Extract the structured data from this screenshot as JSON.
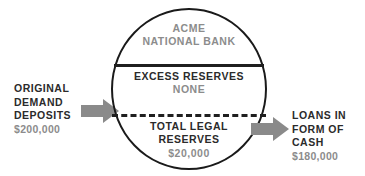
{
  "diagram": {
    "colors": {
      "stroke": "#1a1a1a",
      "text_dark": "#2b2b2b",
      "text_gray": "#8c8c8c",
      "arrow_fill": "#8a8a8a",
      "background": "#ffffff"
    },
    "bank": {
      "header": {
        "line1": "ACME",
        "line2": "NATIONAL BANK"
      },
      "sections": [
        {
          "id": "excess-reserves",
          "label": "EXCESS RESERVES",
          "value": "NONE"
        },
        {
          "id": "total-legal-reserves",
          "label_line1": "TOTAL LEGAL",
          "label_line2": "RESERVES",
          "value": "$20,000"
        }
      ]
    },
    "inflow": {
      "line1": "ORIGINAL",
      "line2": "DEMAND",
      "line3": "DEPOSITS",
      "amount": "$200,000",
      "arrow_icon": "arrow-right-icon"
    },
    "outflow": {
      "line1": "LOANS IN",
      "line2": "FORM OF",
      "line3": "CASH",
      "amount": "$180,000",
      "arrow_icon": "arrow-right-icon"
    }
  }
}
